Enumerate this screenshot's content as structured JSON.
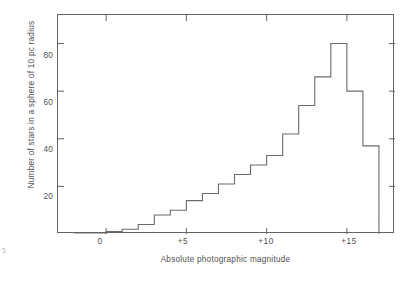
{
  "figure": {
    "corner_mark": "5"
  },
  "chart_data": {
    "type": "bar",
    "title": "",
    "subtitle": "",
    "xlabel": "Absolute photographic magnitude",
    "ylabel": "Number of stars in a sphere of 10 pc radius",
    "xlim": [
      -3,
      18
    ],
    "ylim": [
      0,
      92
    ],
    "grid": false,
    "legend": null,
    "xticks": [
      0,
      5,
      10,
      15
    ],
    "xtick_labels": [
      "0",
      "+5",
      "+10",
      "+15"
    ],
    "yticks": [
      20,
      40,
      60,
      80
    ],
    "ytick_labels": [
      "20",
      "40",
      "60",
      "80"
    ],
    "bin_width": 1,
    "bin_starts": [
      -2,
      -1,
      0,
      1,
      2,
      3,
      4,
      5,
      6,
      7,
      8,
      9,
      10,
      11,
      12,
      13,
      14,
      15,
      16
    ],
    "categories": [
      "-2 to -1",
      "-1 to 0",
      "0 to +1",
      "+1 to +2",
      "+2 to +3",
      "+3 to +4",
      "+4 to +5",
      "+5 to +6",
      "+6 to +7",
      "+7 to +8",
      "+8 to +9",
      "+9 to +10",
      "+10 to +11",
      "+11 to +12",
      "+12 to +13",
      "+13 to +14",
      "+14 to +15",
      "+15 to +16",
      "+16 to +17"
    ],
    "values": [
      0,
      0,
      1,
      2,
      4,
      8,
      10,
      14,
      17,
      21,
      25,
      29,
      33,
      42,
      54,
      66,
      80,
      60,
      37
    ],
    "peak_value": 80,
    "peak_bin": "+14 to +15",
    "line_color": "#6b6b6b",
    "frame_color": "#636363",
    "background_color": "#ffffff"
  }
}
